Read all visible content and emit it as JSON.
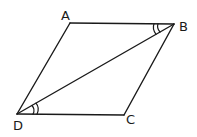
{
  "diagram": {
    "type": "parallelogram",
    "vertices": {
      "A": {
        "label": "A",
        "x": 70,
        "y": 23
      },
      "B": {
        "label": "B",
        "x": 174,
        "y": 24
      },
      "C": {
        "label": "C",
        "x": 124,
        "y": 115
      },
      "D": {
        "label": "D",
        "x": 17,
        "y": 114
      }
    },
    "edges": [
      "AB",
      "BC",
      "CD",
      "DA"
    ],
    "diagonals": [
      "BD"
    ],
    "angle_marks": [
      {
        "at": "B",
        "between": [
          "BA",
          "BD"
        ],
        "arcs": 2
      },
      {
        "at": "D",
        "between": [
          "DC",
          "DB"
        ],
        "arcs": 2
      }
    ],
    "colors": {
      "stroke": "#1a1a1a",
      "background": "#ffffff"
    }
  }
}
